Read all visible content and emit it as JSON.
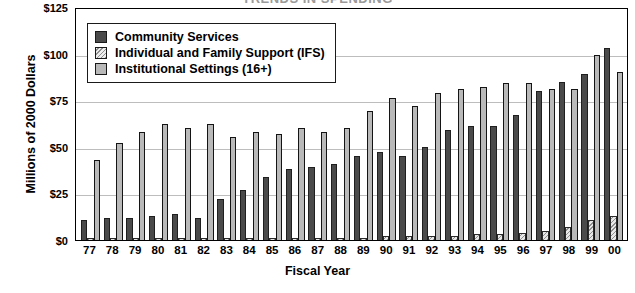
{
  "chart_data": {
    "type": "bar",
    "title": "TRENDS IN SPENDING",
    "xlabel": "Fiscal Year",
    "ylabel": "Millions of 2000 Dollars",
    "ylim": [
      0,
      125
    ],
    "yticks": [
      "$0",
      "$25",
      "$50",
      "$75",
      "$100",
      "$125"
    ],
    "ytick_values": [
      0,
      25,
      50,
      75,
      100,
      125
    ],
    "grid": true,
    "legend_position": "top-left-inside",
    "categories": [
      "77",
      "78",
      "79",
      "80",
      "81",
      "82",
      "83",
      "84",
      "85",
      "86",
      "87",
      "88",
      "89",
      "90",
      "91",
      "92",
      "93",
      "94",
      "95",
      "96",
      "97",
      "98",
      "99",
      "00"
    ],
    "series": [
      {
        "name": "Community Services",
        "color": "#4a4a4a",
        "pattern": "solid",
        "values": [
          11,
          12,
          12,
          13,
          14,
          12,
          22,
          27,
          34,
          38,
          39,
          41,
          45,
          47,
          45,
          50,
          59,
          61,
          61,
          67,
          80,
          85,
          89,
          103
        ]
      },
      {
        "name": "Individual and Family Support (IFS)",
        "color": "#e2e2e2",
        "pattern": "diagonal-hatch",
        "values": [
          1,
          1,
          1,
          1,
          1,
          1,
          1,
          1,
          1,
          1,
          1,
          1,
          1,
          2,
          2,
          2,
          2,
          3,
          3,
          4,
          5,
          7,
          11,
          13
        ]
      },
      {
        "name": "Institutional Settings (16+)",
        "color": "#b9b9b9",
        "pattern": "solid-outlined",
        "values": [
          43,
          52,
          58,
          62,
          60,
          62,
          55,
          58,
          57,
          60,
          58,
          60,
          69,
          76,
          72,
          79,
          81,
          82,
          84,
          84,
          81,
          81,
          99,
          90
        ]
      }
    ]
  }
}
